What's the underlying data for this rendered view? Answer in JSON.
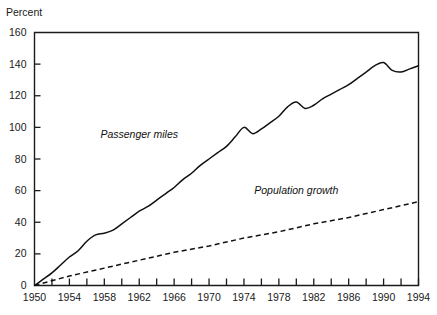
{
  "chart_data": {
    "type": "line",
    "title": "",
    "subtitle": "",
    "xlabel": "",
    "ylabel": "Percent",
    "xlim": [
      1950,
      1994
    ],
    "ylim": [
      0,
      160
    ],
    "grid": false,
    "legend_position": "inline-annotations",
    "y_ticks": [
      0,
      20,
      40,
      60,
      80,
      100,
      120,
      140,
      160
    ],
    "y_tick_labels": [
      "0",
      "20",
      "40",
      "60",
      "80",
      "100",
      "120",
      "140",
      "160"
    ],
    "x_ticks": [
      1950,
      1952,
      1954,
      1956,
      1958,
      1960,
      1962,
      1964,
      1966,
      1968,
      1970,
      1972,
      1974,
      1976,
      1978,
      1980,
      1982,
      1984,
      1986,
      1988,
      1990,
      1992,
      1994
    ],
    "x_tick_labels_shown": [
      "1950",
      "1954",
      "1958",
      "1962",
      "1966",
      "1970",
      "1974",
      "1978",
      "1982",
      "1986",
      "1990",
      "1994"
    ],
    "x_tick_label_years": [
      1950,
      1954,
      1958,
      1962,
      1966,
      1970,
      1974,
      1978,
      1982,
      1986,
      1990,
      1994
    ],
    "annotations": [
      {
        "text": "Passenger miles",
        "x": 1962,
        "y": 93
      },
      {
        "text": "Population growth",
        "x": 1980,
        "y": 58
      }
    ],
    "series": [
      {
        "name": "Passenger miles",
        "style": "solid",
        "color": "#111111",
        "x": [
          1950,
          1951,
          1952,
          1953,
          1954,
          1955,
          1956,
          1957,
          1958,
          1959,
          1960,
          1961,
          1962,
          1963,
          1964,
          1965,
          1966,
          1967,
          1968,
          1969,
          1970,
          1971,
          1972,
          1973,
          1974,
          1975,
          1976,
          1977,
          1978,
          1979,
          1980,
          1981,
          1982,
          1983,
          1984,
          1985,
          1986,
          1987,
          1988,
          1989,
          1990,
          1991,
          1992,
          1993,
          1994
        ],
        "values": [
          0,
          4,
          8,
          13,
          18,
          22,
          28,
          32,
          33,
          35,
          39,
          43,
          47,
          50,
          54,
          58,
          62,
          67,
          71,
          76,
          80,
          84,
          88,
          94,
          100,
          96,
          99,
          103,
          107,
          113,
          116,
          112,
          114,
          118,
          121,
          124,
          127,
          131,
          135,
          139,
          141,
          136,
          135,
          137,
          139
        ]
      },
      {
        "name": "Population growth",
        "style": "dashed",
        "color": "#111111",
        "x": [
          1950,
          1954,
          1958,
          1962,
          1966,
          1970,
          1974,
          1978,
          1982,
          1986,
          1990,
          1994
        ],
        "values": [
          0,
          6,
          11,
          16,
          21,
          25,
          30,
          34,
          39,
          43,
          48,
          53
        ]
      }
    ]
  },
  "figure": {
    "ylabel_text": "Percent"
  }
}
